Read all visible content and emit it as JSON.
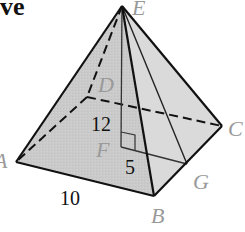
{
  "heading": {
    "text": "ve"
  },
  "figure": {
    "type": "square pyramid",
    "vertices": {
      "E": {
        "label": "E",
        "x": 122,
        "y": 6
      },
      "A": {
        "label": "A",
        "x": 16,
        "y": 162
      },
      "B": {
        "label": "B",
        "x": 154,
        "y": 196
      },
      "C": {
        "label": "C",
        "x": 222,
        "y": 126
      },
      "D": {
        "label": "D",
        "x": 87,
        "y": 97
      },
      "F": {
        "label": "F",
        "x": 121,
        "y": 147
      },
      "G": {
        "label": "G",
        "x": 187,
        "y": 164
      }
    },
    "measurements": {
      "height": "12",
      "apothem_base": "5",
      "base_edge": "10"
    },
    "colors": {
      "edge": "#111111",
      "face_left": "#c4c4c4",
      "face_front": "#d3d3d3",
      "face_right": "#dcdcdc",
      "label": "#9a9a9a"
    }
  }
}
